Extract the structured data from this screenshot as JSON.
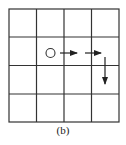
{
  "figure": {
    "caption": "(b)",
    "grid": {
      "rows": 4,
      "cols": 4
    },
    "start_marker": {
      "shape": "circle",
      "row": 1,
      "col": 1
    },
    "arrows": [
      {
        "direction": "right",
        "from": [
          1,
          1
        ],
        "to": [
          1,
          2
        ]
      },
      {
        "direction": "right",
        "from": [
          1,
          2
        ],
        "to": [
          1,
          3
        ]
      },
      {
        "direction": "down",
        "from": [
          1,
          3
        ],
        "to": [
          2,
          3
        ]
      }
    ],
    "line_color": "#333333"
  }
}
